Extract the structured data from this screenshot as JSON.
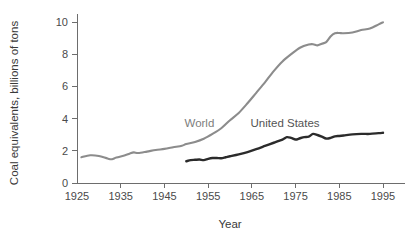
{
  "chart_data": {
    "type": "line",
    "title": "",
    "xlabel": "Year",
    "ylabel": "Coal equivalents, billions of tons",
    "xlim": [
      1925,
      1997
    ],
    "ylim": [
      0,
      10.6
    ],
    "xticks": [
      1925,
      1935,
      1945,
      1955,
      1965,
      1975,
      1985,
      1995
    ],
    "xticklabels": [
      "1925",
      "1935",
      "1945",
      "1955",
      "1965",
      "1975",
      "1985",
      "1995"
    ],
    "yticks": [
      0,
      2,
      4,
      6,
      8,
      10
    ],
    "yticklabels": [
      "0",
      "2",
      "4",
      "6",
      "8",
      "10"
    ],
    "grid": false,
    "legend_position": "inline-annotation",
    "series": [
      {
        "name": "World",
        "color": "#8c8c8c",
        "annotation_label": "World",
        "x": [
          1926,
          1928,
          1930,
          1932,
          1933,
          1934,
          1936,
          1937,
          1938,
          1939,
          1941,
          1943,
          1945,
          1947,
          1949,
          1950,
          1952,
          1954,
          1956,
          1958,
          1960,
          1962,
          1964,
          1966,
          1968,
          1970,
          1972,
          1974,
          1976,
          1978,
          1979,
          1980,
          1981,
          1982,
          1983,
          1984,
          1985,
          1986,
          1988,
          1990,
          1992,
          1994,
          1995
        ],
        "values": [
          1.6,
          1.72,
          1.68,
          1.52,
          1.48,
          1.58,
          1.72,
          1.82,
          1.9,
          1.86,
          1.95,
          2.05,
          2.12,
          2.22,
          2.32,
          2.42,
          2.55,
          2.75,
          3.05,
          3.4,
          3.9,
          4.35,
          4.95,
          5.6,
          6.25,
          6.95,
          7.55,
          8.0,
          8.4,
          8.6,
          8.62,
          8.55,
          8.65,
          8.75,
          9.1,
          9.3,
          9.32,
          9.3,
          9.35,
          9.5,
          9.6,
          9.85,
          9.98
        ]
      },
      {
        "name": "United States",
        "color": "#2b2b2b",
        "annotation_label": "United States",
        "x": [
          1950,
          1951,
          1952,
          1953,
          1954,
          1955,
          1956,
          1957,
          1958,
          1959,
          1960,
          1962,
          1964,
          1966,
          1968,
          1970,
          1972,
          1973,
          1974,
          1975,
          1976,
          1977,
          1978,
          1979,
          1980,
          1981,
          1982,
          1983,
          1984,
          1985,
          1986,
          1988,
          1990,
          1992,
          1994,
          1995
        ],
        "values": [
          1.35,
          1.42,
          1.44,
          1.46,
          1.42,
          1.5,
          1.55,
          1.55,
          1.54,
          1.6,
          1.66,
          1.78,
          1.92,
          2.1,
          2.3,
          2.5,
          2.7,
          2.85,
          2.8,
          2.7,
          2.78,
          2.85,
          2.88,
          3.05,
          2.98,
          2.88,
          2.76,
          2.8,
          2.9,
          2.92,
          2.95,
          3.02,
          3.05,
          3.05,
          3.1,
          3.12
        ]
      }
    ],
    "annotations": [
      {
        "text": "World",
        "x": 1953.0,
        "y": 3.45
      },
      {
        "text": "United States",
        "x": 1972.6,
        "y": 3.48
      }
    ]
  }
}
